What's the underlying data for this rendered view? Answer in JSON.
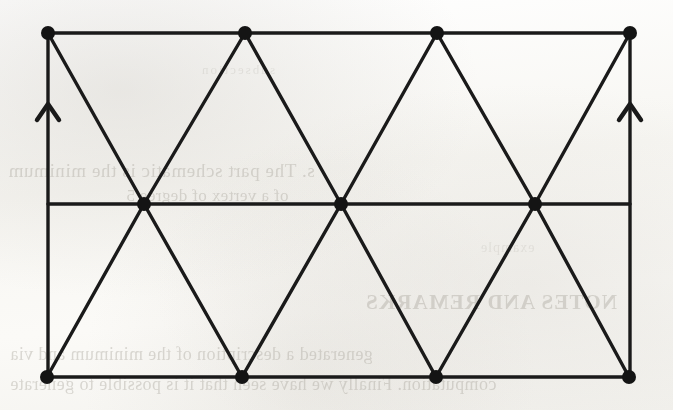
{
  "page": {
    "width": 673,
    "height": 410,
    "background_color": "#fdfdfb",
    "ink_color": "#1a1a1a",
    "bleed_text_color": "#a9a59c"
  },
  "figure": {
    "name": "triangulated-cylinder-identification-diagram",
    "stroke_color": "#1a1a1a",
    "stroke_width": 3.4,
    "vertex_radius": 7,
    "vertex_fill": "#141414",
    "top_row_y": 33,
    "middle_row_y": 204,
    "bottom_row_y": 377,
    "top_vertices_x": [
      48,
      245,
      437,
      630
    ],
    "middle_vertices_x": [
      144,
      341,
      535
    ],
    "bottom_vertices_x": [
      47,
      242,
      436,
      629
    ],
    "left_edge_x": 48,
    "right_edge_x": 630,
    "arrows": [
      {
        "name": "left-edge-arrow",
        "x": 48,
        "tip_y": 104,
        "direction": "up"
      },
      {
        "name": "right-edge-arrow",
        "x": 630,
        "tip_y": 104,
        "direction": "up"
      }
    ],
    "horizontal_lines": [
      {
        "name": "top-edge",
        "y": 33,
        "x1": 48,
        "x2": 630
      },
      {
        "name": "middle-line",
        "y": 204,
        "x1": 48,
        "x2": 630
      },
      {
        "name": "bottom-edge",
        "y": 377,
        "x1": 47,
        "x2": 629
      }
    ],
    "vertical_lines": [
      {
        "name": "left-edge",
        "x": 48,
        "y1": 33,
        "y2": 377
      },
      {
        "name": "right-edge",
        "x": 630,
        "y1": 33,
        "y2": 377
      }
    ],
    "diagonal_edges": [
      {
        "name": "upper-zigzag",
        "points": "48,33 144,204 245,33 341,204 437,33 535,204 630,33"
      },
      {
        "name": "lower-zigzag",
        "points": "47,377 144,204 242,377 341,204 436,377 535,204 629,377"
      }
    ]
  },
  "bleed_through": {
    "line_1": "s. The part schematic  is the minimum",
    "line_2": "of a vertex of degree 5",
    "line_3": "NOTES AND REMARKS",
    "line_4": "generated a description of the minimum and via",
    "line_5": "computation. Finally we have seen that it is possible to generate",
    "line_6": "subsection",
    "line_7": "example"
  }
}
